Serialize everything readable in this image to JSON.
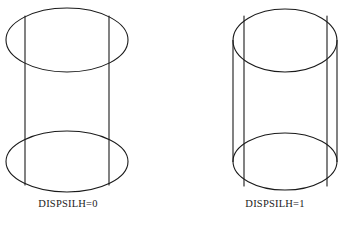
{
  "figure": {
    "background_color": "#ffffff",
    "stroke_color": "#1a1a1a",
    "stroke_width": 1,
    "objects": [
      {
        "id": "cylinder-dispsilh-0",
        "name": "left-cylinder",
        "caption": "DISPSILH=0",
        "silhouette_edges_shown": false,
        "top_ellipse": {
          "cx": 67,
          "cy": 40,
          "rx": 61,
          "ry": 32
        },
        "bottom_ellipse": {
          "cx": 67,
          "cy": 161.5,
          "rx": 61,
          "ry": 30.5
        },
        "vertical_lines": [
          {
            "x": 25,
            "y1": 16,
            "y2": 185,
            "type": "facet"
          },
          {
            "x": 109,
            "y1": 16,
            "y2": 185,
            "type": "facet"
          }
        ]
      },
      {
        "id": "cylinder-dispsilh-1",
        "name": "right-cylinder",
        "caption": "DISPSILH=1",
        "silhouette_edges_shown": true,
        "top_ellipse": {
          "cx": 285,
          "cy": 40.5,
          "rx": 52,
          "ry": 31.5
        },
        "bottom_ellipse": {
          "cx": 285,
          "cy": 161.5,
          "rx": 52,
          "ry": 28.5
        },
        "vertical_lines": [
          {
            "x": 233,
            "y1": 40.5,
            "y2": 161.5,
            "type": "silhouette"
          },
          {
            "x": 244,
            "y1": 16,
            "y2": 186,
            "type": "facet"
          },
          {
            "x": 327,
            "y1": 16,
            "y2": 186,
            "type": "facet"
          },
          {
            "x": 337,
            "y1": 40.5,
            "y2": 161.5,
            "type": "silhouette"
          }
        ]
      }
    ]
  },
  "captions": {
    "left": "DISPSILH=0",
    "right": "DISPSILH=1"
  }
}
